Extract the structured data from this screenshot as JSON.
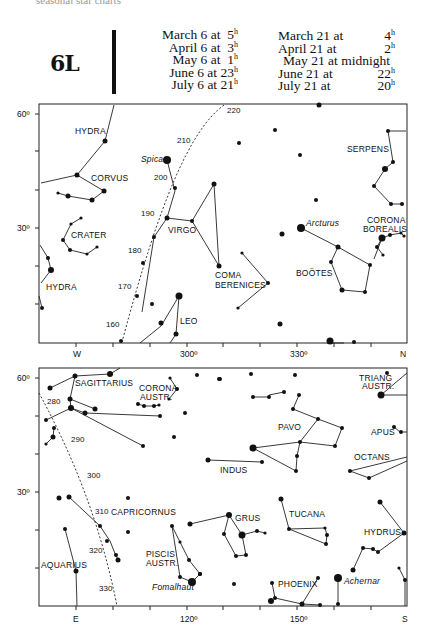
{
  "header": {
    "cut_text": "seasonal star charts",
    "chart_id": "6L",
    "times_left": [
      {
        "date": "March 6 at",
        "hour": "5",
        "unit": "h"
      },
      {
        "date": "April 6 at",
        "hour": "3",
        "unit": "h"
      },
      {
        "date": "May 6 at",
        "hour": "1",
        "unit": "h"
      },
      {
        "date": "June 6 at",
        "hour": "23",
        "unit": "h"
      },
      {
        "date": "July 6 at",
        "hour": "21",
        "unit": "h"
      }
    ],
    "times_right": [
      {
        "date": "March 21 at",
        "hour": "4",
        "unit": "h"
      },
      {
        "date": "April 21 at",
        "hour": "2",
        "unit": "h"
      },
      {
        "date": "May 21 at midnight",
        "hour": "",
        "unit": ""
      },
      {
        "date": "June 21 at",
        "hour": "22",
        "unit": "h"
      },
      {
        "date": "July 21 at",
        "hour": "20",
        "unit": "h"
      }
    ]
  },
  "top_panel": {
    "y_ticks": [
      "60º",
      "30º"
    ],
    "x_ticks": [
      "W",
      "300º",
      "330º",
      "N"
    ],
    "ecliptic_marks": [
      "220",
      "210",
      "200",
      "190",
      "180",
      "170",
      "160"
    ],
    "constellations": [
      "HYDRA",
      "CORVUS",
      "CRATER",
      "HYDRA",
      "VIRGO",
      "COMA",
      "BERENICES",
      "LEO",
      "SERPENS",
      "BOÖTES",
      "CORONA",
      "BOREALIS"
    ],
    "stars": [
      "Spica",
      "Arcturus"
    ]
  },
  "bottom_panel": {
    "y_ticks": [
      "60º",
      "30º"
    ],
    "x_ticks": [
      "E",
      "120º",
      "150º",
      "S"
    ],
    "ecliptic_marks": [
      "280",
      "290",
      "300",
      "310",
      "320",
      "330"
    ],
    "constellations": [
      "SAGITTARIUS",
      "CORONA",
      "AUSTR.",
      "TRIANG",
      "AUSTR.",
      "PAVO",
      "APUS",
      "INDUS",
      "OCTANS",
      "CAPRICORNUS",
      "TUCANA",
      "GRUS",
      "HYDRUS",
      "PISCIS",
      "AUSTR.",
      "AQUARIUS",
      "PHOENIX"
    ],
    "stars": [
      "Fomalhaut",
      "Achernar"
    ]
  }
}
